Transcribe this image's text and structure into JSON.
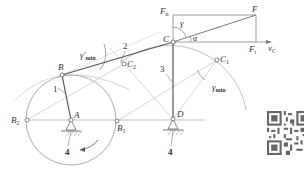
{
  "figure": {
    "type": "four-bar linkage pressure angle / transmission angle diagram",
    "points": {
      "A": {
        "label": "A",
        "x": 71,
        "y": 120
      },
      "B": {
        "label": "B",
        "x": 62,
        "y": 75
      },
      "B1": {
        "label": "B",
        "sub": "1",
        "x": 117,
        "y": 121
      },
      "B2": {
        "label": "B",
        "sub": "2",
        "x": 27,
        "y": 120
      },
      "C": {
        "label": "C",
        "x": 173,
        "y": 42
      },
      "C1": {
        "label": "C",
        "sub": "1",
        "x": 217,
        "y": 60
      },
      "C2": {
        "label": "C",
        "sub": "2",
        "x": 124,
        "y": 64
      },
      "D": {
        "label": "D",
        "x": 173,
        "y": 119
      },
      "F": {
        "label": "F",
        "x": 256,
        "y": 15
      }
    },
    "links": {
      "crank": "1",
      "coupler": "2",
      "rocker": "3",
      "frame_left": "4",
      "frame_right": "4"
    },
    "force_labels": {
      "Fn": {
        "main": "F",
        "sub": "n"
      },
      "Ft": {
        "main": "F",
        "sub": "t"
      },
      "F": "F",
      "vC": {
        "main": "v",
        "sub": "C"
      }
    },
    "angle_labels": {
      "gamma": "γ",
      "alpha": "α",
      "gamma_min": {
        "main": "γ",
        "sub": "min"
      },
      "gamma_min_prime": {
        "main": "γ'",
        "sub": "min"
      }
    }
  }
}
